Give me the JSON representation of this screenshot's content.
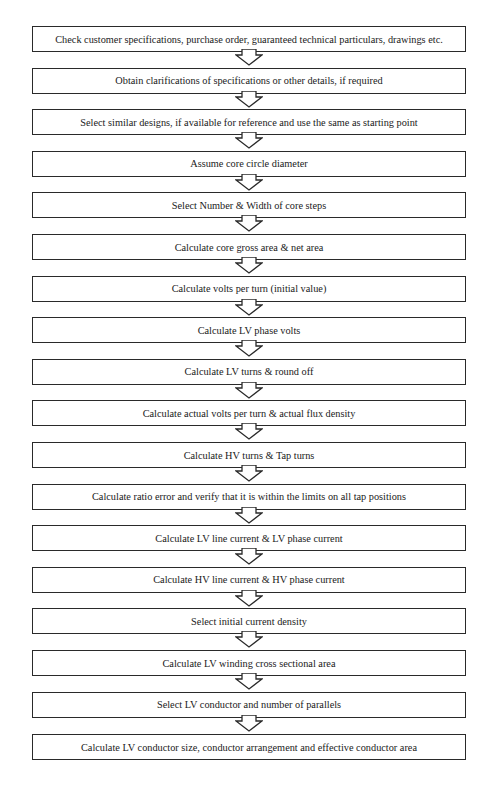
{
  "flowchart": {
    "steps": [
      {
        "label": "Check customer specifications, purchase order, guaranteed technical particulars, drawings etc."
      },
      {
        "label": "Obtain clarifications of specifications or other details, if required"
      },
      {
        "label": "Select similar designs, if available for reference and use the same as starting point"
      },
      {
        "label": "Assume core circle diameter"
      },
      {
        "label": "Select Number & Width of core steps"
      },
      {
        "label": "Calculate core gross area & net area"
      },
      {
        "label": "Calculate volts per turn (initial value)"
      },
      {
        "label": "Calculate LV phase volts"
      },
      {
        "label": "Calculate LV turns & round off"
      },
      {
        "label": "Calculate actual volts per turn & actual flux density"
      },
      {
        "label": "Calculate HV turns & Tap turns"
      },
      {
        "label": "Calculate ratio error and verify that it is within the limits on all tap positions"
      },
      {
        "label": "Calculate LV line current & LV phase current"
      },
      {
        "label": "Calculate HV line current & HV phase current"
      },
      {
        "label": "Select initial current density"
      },
      {
        "label": "Calculate LV winding cross sectional area"
      },
      {
        "label": "Select LV conductor and number of parallels"
      },
      {
        "label": "Calculate LV conductor size, conductor arrangement and effective conductor area"
      }
    ],
    "connector": "hollow-down-arrow-icon",
    "colors": {
      "border": "#2a2a2a",
      "text": "#1a1a1a",
      "background": "#ffffff"
    }
  }
}
